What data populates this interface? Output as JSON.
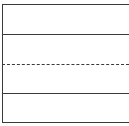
{
  "diagram": {
    "type": "staff-lines",
    "line_color": "#3a3a3a",
    "lines": [
      {
        "y": 4,
        "style": "solid"
      },
      {
        "y": 34,
        "style": "solid"
      },
      {
        "y": 64,
        "style": "dashed"
      },
      {
        "y": 93,
        "style": "solid"
      },
      {
        "y": 122,
        "style": "solid"
      }
    ]
  }
}
